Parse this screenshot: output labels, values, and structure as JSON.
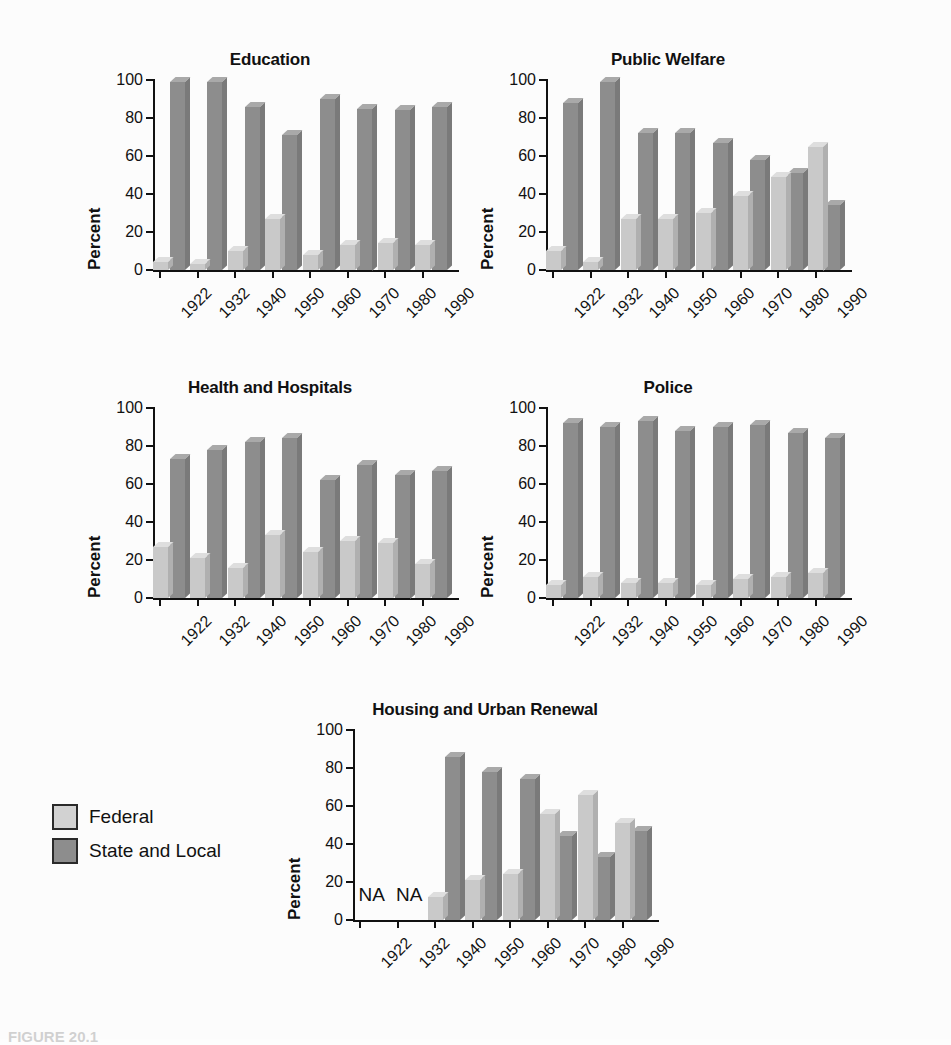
{
  "figure": {
    "background_color": "#fcfcfc",
    "caption": "FIGURE 20.1",
    "ylabel": "Percent",
    "yticks": [
      "0",
      "20",
      "40",
      "60",
      "80",
      "100"
    ],
    "na_label": "NA"
  },
  "legend": {
    "position": "bottom-left",
    "items": [
      {
        "label": "Federal",
        "color": "#d2d2d2"
      },
      {
        "label": "State and Local",
        "color": "#8d8d8d"
      }
    ]
  },
  "chart_data": [
    {
      "type": "bar",
      "title": "Education",
      "xlabel": "",
      "ylabel": "Percent",
      "ylim": [
        0,
        100
      ],
      "yticks": [
        0,
        20,
        40,
        60,
        80,
        100
      ],
      "grid": false,
      "legend_position": "external-bottom-left",
      "categories": [
        "1922",
        "1932",
        "1940",
        "1950",
        "1960",
        "1970",
        "1980",
        "1990"
      ],
      "series": [
        {
          "name": "Federal",
          "color": "#d2d2d2",
          "values": [
            4,
            3,
            10,
            27,
            8,
            13,
            14,
            13
          ]
        },
        {
          "name": "State and Local",
          "color": "#8d8d8d",
          "values": [
            99,
            99,
            86,
            71,
            90,
            85,
            84,
            86
          ]
        }
      ]
    },
    {
      "type": "bar",
      "title": "Public Welfare",
      "xlabel": "",
      "ylabel": "Percent",
      "ylim": [
        0,
        100
      ],
      "yticks": [
        0,
        20,
        40,
        60,
        80,
        100
      ],
      "grid": false,
      "categories": [
        "1922",
        "1932",
        "1940",
        "1950",
        "1960",
        "1970",
        "1980",
        "1990"
      ],
      "series": [
        {
          "name": "Federal",
          "color": "#d2d2d2",
          "values": [
            10,
            4,
            27,
            27,
            30,
            39,
            49,
            65
          ]
        },
        {
          "name": "State and Local",
          "color": "#8d8d8d",
          "values": [
            88,
            99,
            72,
            72,
            67,
            58,
            51,
            34
          ]
        }
      ]
    },
    {
      "type": "bar",
      "title": "Health and Hospitals",
      "xlabel": "",
      "ylabel": "Percent",
      "ylim": [
        0,
        100
      ],
      "yticks": [
        0,
        20,
        40,
        60,
        80,
        100
      ],
      "grid": false,
      "categories": [
        "1922",
        "1932",
        "1940",
        "1950",
        "1960",
        "1970",
        "1980",
        "1990"
      ],
      "series": [
        {
          "name": "Federal",
          "color": "#d2d2d2",
          "values": [
            27,
            21,
            16,
            33,
            24,
            30,
            29,
            18
          ]
        },
        {
          "name": "State and Local",
          "color": "#8d8d8d",
          "values": [
            73,
            78,
            82,
            84,
            62,
            70,
            65,
            67
          ]
        }
      ]
    },
    {
      "type": "bar",
      "title": "Police",
      "xlabel": "",
      "ylabel": "Percent",
      "ylim": [
        0,
        100
      ],
      "yticks": [
        0,
        20,
        40,
        60,
        80,
        100
      ],
      "grid": false,
      "categories": [
        "1922",
        "1932",
        "1940",
        "1950",
        "1960",
        "1970",
        "1980",
        "1990"
      ],
      "series": [
        {
          "name": "Federal",
          "color": "#d2d2d2",
          "values": [
            7,
            11,
            8,
            8,
            7,
            10,
            11,
            13
          ]
        },
        {
          "name": "State and Local",
          "color": "#8d8d8d",
          "values": [
            92,
            90,
            93,
            88,
            90,
            91,
            87,
            84
          ]
        }
      ]
    },
    {
      "type": "bar",
      "title": "Housing and Urban Renewal",
      "xlabel": "",
      "ylabel": "Percent",
      "ylim": [
        0,
        100
      ],
      "yticks": [
        0,
        20,
        40,
        60,
        80,
        100
      ],
      "grid": false,
      "categories": [
        "1922",
        "1932",
        "1940",
        "1950",
        "1960",
        "1970",
        "1980",
        "1990"
      ],
      "na_categories": [
        "1922",
        "1932"
      ],
      "series": [
        {
          "name": "Federal",
          "color": "#d2d2d2",
          "values": [
            null,
            null,
            12,
            21,
            24,
            56,
            66,
            51
          ]
        },
        {
          "name": "State and Local",
          "color": "#8d8d8d",
          "values": [
            null,
            null,
            86,
            78,
            74,
            44,
            33,
            47
          ]
        }
      ]
    }
  ],
  "panels": [
    {
      "id": "education",
      "title": "Education"
    },
    {
      "id": "welfare",
      "title": "Public Welfare"
    },
    {
      "id": "health",
      "title": "Health and Hospitals"
    },
    {
      "id": "police",
      "title": "Police"
    },
    {
      "id": "housing",
      "title": "Housing and Urban Renewal"
    }
  ]
}
